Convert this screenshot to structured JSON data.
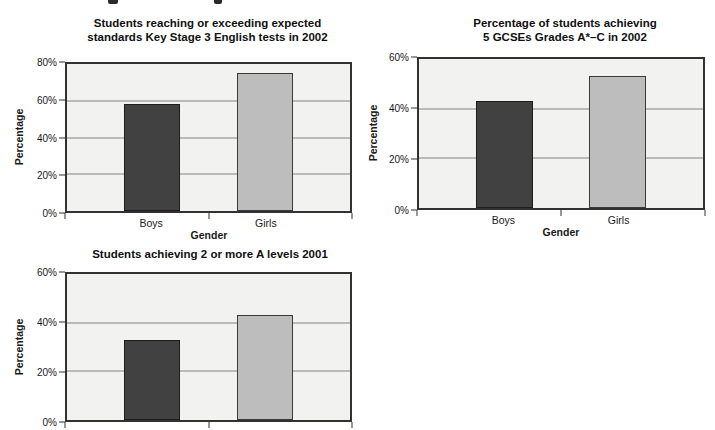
{
  "figure": {
    "background": "#ffffff",
    "plot_background": "#f2f2f0",
    "gridline_color": "#828282",
    "axis_color": "#323232"
  },
  "chart_data": [
    {
      "type": "bar",
      "title": "Students reaching or exceeding expected standards Key Stage 3 English tests in 2002",
      "title_lines": [
        "Students reaching or exceeding expected",
        "standards Key Stage 3 English tests in 2002"
      ],
      "categories": [
        "Boys",
        "Girls"
      ],
      "values": [
        58,
        75
      ],
      "xlabel": "Gender",
      "ylabel": "Percentage",
      "ylim": [
        0,
        80
      ],
      "ytick_labels": [
        "0%",
        "20%",
        "40%",
        "60%",
        "80%"
      ],
      "grid": true,
      "legend": false,
      "category_labels_visible": true,
      "bar_colors": [
        "#414141",
        "#bdbdbd"
      ],
      "bar_border_colors": [
        "#1c1c1c",
        "#3a3a3a"
      ]
    },
    {
      "type": "bar",
      "title": "Percentage of students achieving 5 GCSEs Grades A*–C in 2002",
      "title_lines": [
        "Percentage of students achieving",
        "5 GCSEs Grades A*–C in 2002"
      ],
      "categories": [
        "Boys",
        "Girls"
      ],
      "values": [
        43,
        53
      ],
      "xlabel": "Gender",
      "ylabel": "Percentage",
      "ylim": [
        0,
        60
      ],
      "ytick_labels": [
        "0%",
        "20%",
        "40%",
        "60%"
      ],
      "grid": true,
      "legend": false,
      "category_labels_visible": true,
      "bar_colors": [
        "#414141",
        "#bdbdbd"
      ],
      "bar_border_colors": [
        "#1c1c1c",
        "#3a3a3a"
      ]
    },
    {
      "type": "bar",
      "title": "Students achieving 2 or more A levels 2001",
      "title_lines": [
        "Students achieving 2 or more A levels 2001"
      ],
      "categories": [
        "Boys",
        "Girls"
      ],
      "values": [
        33,
        43
      ],
      "xlabel": "",
      "ylabel": "Percentage",
      "ylim": [
        0,
        60
      ],
      "ytick_labels": [
        "0%",
        "20%",
        "40%",
        "60%"
      ],
      "grid": true,
      "legend": false,
      "category_labels_visible": false,
      "bar_colors": [
        "#414141",
        "#bdbdbd"
      ],
      "bar_border_colors": [
        "#1c1c1c",
        "#3a3a3a"
      ]
    }
  ]
}
